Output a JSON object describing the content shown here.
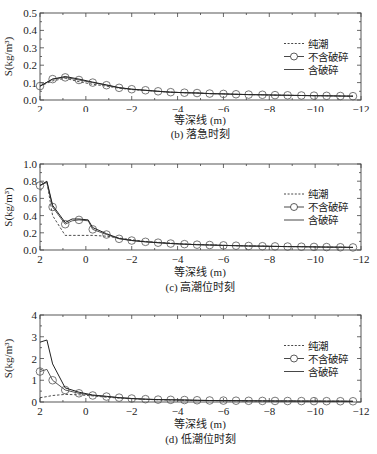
{
  "chart_data": [
    {
      "type": "line",
      "id": "b",
      "title": "(b) 落急时刻",
      "xlabel": "等深线 (m)",
      "ylabel": "S(kg/m³)",
      "xlim": [
        2,
        -12
      ],
      "ylim": [
        0,
        0.5
      ],
      "xticks": [
        "2",
        "0",
        "−2",
        "−4",
        "−6",
        "−8",
        "−10",
        "−12"
      ],
      "yticks": [
        "0.0",
        "0.1",
        "0.2",
        "0.3",
        "0.4",
        "0.5"
      ],
      "legend": [
        "纯潮",
        "不含破碎",
        "含破碎"
      ],
      "legend_position": "right-middle",
      "grid": false,
      "x": [
        2,
        1.45,
        0.9,
        0.3,
        -0.3,
        -0.9,
        -1.45,
        -2,
        -2.6,
        -3.15,
        -3.7,
        -4.3,
        -4.85,
        -5.4,
        -6,
        -6.55,
        -7.1,
        -7.7,
        -8.25,
        -8.8,
        -9.4,
        -9.95,
        -10.5,
        -11.1,
        -11.65
      ],
      "series": [
        {
          "name": "纯潮",
          "style": "dashed",
          "values": [
            0.08,
            0.11,
            0.125,
            0.105,
            0.09,
            0.08,
            0.068,
            0.06,
            0.055,
            0.05,
            0.045,
            0.042,
            0.04,
            0.037,
            0.035,
            0.033,
            0.031,
            0.03,
            0.028,
            0.027,
            0.026,
            0.025,
            0.024,
            0.023,
            0.022
          ]
        },
        {
          "name": "不含破碎",
          "style": "solid-circle",
          "values": [
            0.08,
            0.12,
            0.13,
            0.115,
            0.1,
            0.085,
            0.07,
            0.062,
            0.056,
            0.05,
            0.045,
            0.042,
            0.04,
            0.037,
            0.035,
            0.033,
            0.031,
            0.03,
            0.028,
            0.027,
            0.026,
            0.025,
            0.024,
            0.023,
            0.022
          ]
        },
        {
          "name": "含破碎",
          "style": "solid",
          "values": [
            0.08,
            0.12,
            0.135,
            0.12,
            0.103,
            0.087,
            0.071,
            0.062,
            0.056,
            0.05,
            0.045,
            0.042,
            0.04,
            0.037,
            0.035,
            0.033,
            0.031,
            0.03,
            0.028,
            0.027,
            0.026,
            0.025,
            0.024,
            0.023,
            0.022
          ]
        }
      ]
    },
    {
      "type": "line",
      "id": "c",
      "title": "(c) 高潮位时刻",
      "xlabel": "等深线 (m)",
      "ylabel": "S(kg/m³)",
      "xlim": [
        2,
        -12
      ],
      "ylim": [
        0,
        1.0
      ],
      "xticks": [
        "2",
        "0",
        "−2",
        "−4",
        "−6",
        "−8",
        "−10",
        "−12"
      ],
      "yticks": [
        "0.0",
        "0.2",
        "0.4",
        "0.6",
        "0.8",
        "1.0"
      ],
      "legend": [
        "纯潮",
        "不含破碎",
        "含破碎"
      ],
      "legend_position": "right-middle",
      "grid": false,
      "x": [
        2,
        1.7,
        1.45,
        0.9,
        0.6,
        0.3,
        -0.1,
        -0.3,
        -0.9,
        -1.45,
        -2,
        -2.6,
        -3.15,
        -3.7,
        -4.3,
        -4.85,
        -5.4,
        -6,
        -6.55,
        -7.1,
        -7.7,
        -8.25,
        -8.8,
        -9.4,
        -9.95,
        -10.5,
        -11.1,
        -11.65
      ],
      "series": [
        {
          "name": "纯潮",
          "style": "dashed",
          "values": [
            0.75,
            0.79,
            0.4,
            0.17,
            0.17,
            0.17,
            0.17,
            0.17,
            0.16,
            0.14,
            0.12,
            0.1,
            0.09,
            0.08,
            0.07,
            0.065,
            0.06,
            0.055,
            0.05,
            0.048,
            0.045,
            0.042,
            0.04,
            0.038,
            0.036,
            0.034,
            0.032,
            0.03
          ]
        },
        {
          "name": "不含破碎",
          "style": "solid-circle",
          "values": [
            0.75,
            0.79,
            0.5,
            0.3,
            0.34,
            0.35,
            0.34,
            0.24,
            0.18,
            0.13,
            0.11,
            0.095,
            0.085,
            0.075,
            0.068,
            0.062,
            0.058,
            0.054,
            0.05,
            0.047,
            0.044,
            0.042,
            0.04,
            0.038,
            0.036,
            0.034,
            0.032,
            0.03
          ]
        },
        {
          "name": "含破碎",
          "style": "solid",
          "values": [
            0.75,
            0.8,
            0.52,
            0.32,
            0.36,
            0.36,
            0.35,
            0.26,
            0.19,
            0.135,
            0.11,
            0.095,
            0.085,
            0.075,
            0.068,
            0.062,
            0.058,
            0.054,
            0.05,
            0.047,
            0.044,
            0.042,
            0.04,
            0.038,
            0.036,
            0.034,
            0.032,
            0.03
          ]
        }
      ]
    },
    {
      "type": "line",
      "id": "d",
      "title": "(d) 低潮位时刻",
      "xlabel": "等深线 (m)",
      "ylabel": "S(kg/m³)",
      "xlim": [
        2,
        -12
      ],
      "ylim": [
        0,
        4
      ],
      "xticks": [
        "2",
        "0",
        "−2",
        "−4",
        "−6",
        "−8",
        "−10",
        "−12"
      ],
      "yticks": [
        "0",
        "1",
        "2",
        "3",
        "4"
      ],
      "legend": [
        "纯潮",
        "不含破碎",
        "含破碎"
      ],
      "legend_position": "right-middle",
      "grid": false,
      "x": [
        2,
        1.7,
        1.45,
        0.9,
        0.3,
        -0.3,
        -0.9,
        -1.45,
        -2,
        -2.6,
        -3.15,
        -3.7,
        -4.3,
        -4.85,
        -5.4,
        -6,
        -6.55,
        -7.1,
        -7.7,
        -8.25,
        -8.8,
        -9.4,
        -9.95,
        -10.5,
        -11.1,
        -11.65
      ],
      "series": [
        {
          "name": "纯潮",
          "style": "dashed",
          "values": [
            0.2,
            0.25,
            0.3,
            0.35,
            0.33,
            0.28,
            0.22,
            0.18,
            0.15,
            0.12,
            0.1,
            0.09,
            0.08,
            0.07,
            0.065,
            0.06,
            0.055,
            0.05,
            0.048,
            0.045,
            0.042,
            0.04,
            0.038,
            0.036,
            0.034,
            0.032
          ]
        },
        {
          "name": "不含破碎",
          "style": "solid-circle",
          "values": [
            1.4,
            1.5,
            1.0,
            0.55,
            0.4,
            0.3,
            0.25,
            0.2,
            0.16,
            0.13,
            0.11,
            0.1,
            0.09,
            0.08,
            0.07,
            0.065,
            0.06,
            0.055,
            0.05,
            0.048,
            0.045,
            0.042,
            0.04,
            0.038,
            0.036,
            0.034
          ]
        },
        {
          "name": "含破碎",
          "style": "solid",
          "values": [
            2.75,
            2.85,
            1.75,
            0.65,
            0.45,
            0.32,
            0.26,
            0.2,
            0.16,
            0.13,
            0.11,
            0.1,
            0.09,
            0.08,
            0.07,
            0.065,
            0.06,
            0.055,
            0.05,
            0.048,
            0.045,
            0.042,
            0.04,
            0.038,
            0.036,
            0.034
          ]
        }
      ]
    }
  ],
  "panels": {
    "b": {
      "caption": "(b) 落急时刻",
      "xlabel": "等深线 (m)"
    },
    "c": {
      "caption": "(c) 高潮位时刻",
      "xlabel": "等深线 (m)"
    },
    "d": {
      "caption": "(d) 低潮位时刻",
      "xlabel": "等深线 (m)"
    }
  }
}
